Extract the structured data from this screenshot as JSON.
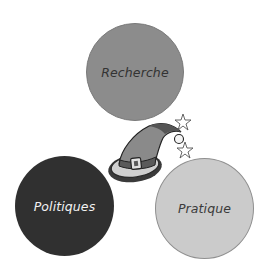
{
  "diagram": {
    "circles": [
      {
        "label": "Recherche",
        "fill": "#8c8c8c",
        "text_color": "#333333"
      },
      {
        "label": "Politiques",
        "fill": "#303030",
        "text_color": "#f2f2f2"
      },
      {
        "label": "Pratique",
        "fill": "#cbcbcb",
        "text_color": "#3a3a3a"
      }
    ],
    "center_icon": "wizard-hat-icon",
    "decorations": [
      "star-icon",
      "star-icon"
    ]
  }
}
